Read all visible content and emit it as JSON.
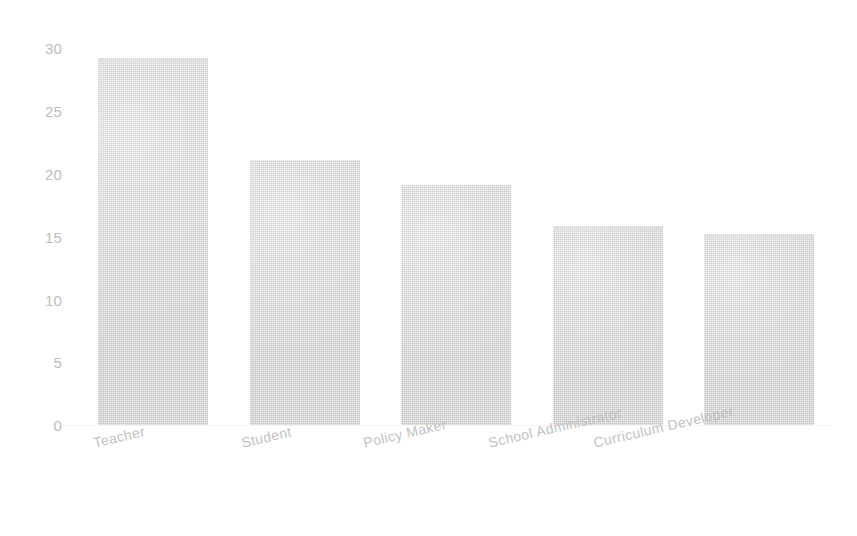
{
  "chart_data": {
    "type": "bar",
    "title": "",
    "subtitle": "",
    "xlabel": "",
    "ylabel": "",
    "categories": [
      "Teacher",
      "Student",
      "Policy Maker",
      "School Administrator",
      "Curriculum Developer"
    ],
    "values": [
      29.2,
      21.1,
      19.1,
      15.8,
      15.2
    ],
    "ylim": [
      0,
      30
    ],
    "yticks": [
      0,
      5,
      10,
      15,
      20,
      25,
      30
    ],
    "ytick_labels": [
      "0",
      "5",
      "10",
      "15",
      "20",
      "25",
      "30"
    ],
    "grid": false,
    "legend": null,
    "bar_color": "#d4d4d4",
    "tick_label_color": "#bdbdbd",
    "background_color": "#ffffff",
    "xtick_rotation_degrees": -13
  }
}
